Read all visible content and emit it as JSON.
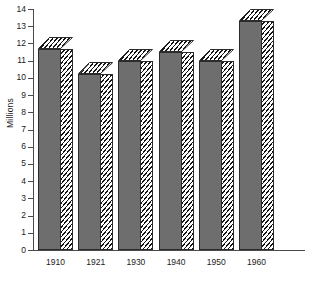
{
  "chart_data": {
    "type": "bar",
    "title": "",
    "xlabel": "",
    "ylabel": "Millions",
    "categories": [
      "1910",
      "1921",
      "1930",
      "1940",
      "1950",
      "1960"
    ],
    "values": [
      11.7,
      10.2,
      11.0,
      11.5,
      11.0,
      13.3
    ],
    "ylim": [
      0,
      14
    ],
    "yticks": [
      "0",
      "1",
      "2",
      "3",
      "4",
      "5",
      "6",
      "7",
      "8",
      "9",
      "10",
      "11",
      "12",
      "13",
      "14"
    ],
    "grid": false,
    "legend": "none",
    "style": {
      "bar_face_color": "#6e6e6e",
      "bar_hatch_color": "#141414",
      "bar_outline_color": "#2b2b2b",
      "axis_color": "#4a4a4a",
      "background": "#ffffff",
      "three_d": true
    }
  }
}
